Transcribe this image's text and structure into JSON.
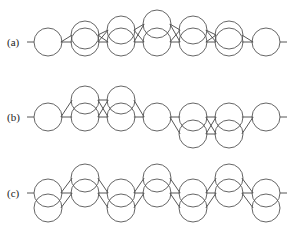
{
  "diagram": {
    "rows": [
      {
        "label": "(a)",
        "baseline_y": 42,
        "radius": 14,
        "nodes": [
          {
            "x": 48,
            "ys": [
              42
            ]
          },
          {
            "x": 85,
            "ys": [
              35,
              42
            ]
          },
          {
            "x": 121,
            "ys": [
              30,
              42
            ]
          },
          {
            "x": 157,
            "ys": [
              24,
              42
            ]
          },
          {
            "x": 193,
            "ys": [
              30,
              42
            ]
          },
          {
            "x": 229,
            "ys": [
              35,
              42
            ]
          },
          {
            "x": 266,
            "ys": [
              42
            ]
          }
        ]
      },
      {
        "label": "(b)",
        "baseline_y": 117,
        "radius": 14,
        "nodes": [
          {
            "x": 48,
            "ys": [
              117
            ]
          },
          {
            "x": 85,
            "ys": [
              100,
              117
            ]
          },
          {
            "x": 121,
            "ys": [
              100,
              117
            ]
          },
          {
            "x": 157,
            "ys": [
              117
            ]
          },
          {
            "x": 193,
            "ys": [
              117,
              134
            ]
          },
          {
            "x": 229,
            "ys": [
              117,
              134
            ]
          },
          {
            "x": 266,
            "ys": [
              117
            ]
          }
        ]
      },
      {
        "label": "(c)",
        "baseline_y": 193,
        "radius": 14,
        "nodes": [
          {
            "x": 48,
            "ys": [
              193,
              208
            ]
          },
          {
            "x": 85,
            "ys": [
              178,
              193
            ]
          },
          {
            "x": 121,
            "ys": [
              193,
              208
            ]
          },
          {
            "x": 157,
            "ys": [
              178,
              193
            ]
          },
          {
            "x": 193,
            "ys": [
              193,
              208
            ]
          },
          {
            "x": 229,
            "ys": [
              178,
              193
            ]
          },
          {
            "x": 266,
            "ys": [
              193,
              208
            ]
          }
        ]
      }
    ],
    "colors": {
      "stroke": "#555555",
      "background": "#ffffff"
    }
  }
}
